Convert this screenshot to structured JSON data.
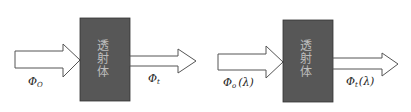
{
  "diagrams": [
    {
      "box": {
        "label_chars": [
          "透",
          "射",
          "体"
        ],
        "color": "#575757"
      },
      "input_label": {
        "symbol": "Φ",
        "subscript": "O",
        "suffix": ""
      },
      "output_label": {
        "symbol": "Φ",
        "subscript": "t",
        "suffix": ""
      }
    },
    {
      "box": {
        "label_chars": [
          "透",
          "射",
          "体"
        ],
        "color": "#575757"
      },
      "input_label": {
        "symbol": "Φ",
        "subscript": "o",
        "suffix": "(λ)"
      },
      "output_label": {
        "symbol": "Φ",
        "subscript": "t",
        "suffix": "(λ)"
      }
    }
  ]
}
